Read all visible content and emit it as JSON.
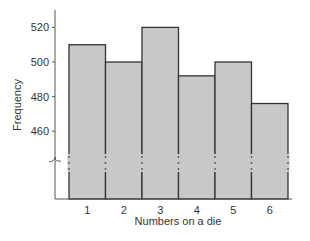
{
  "chart_data": {
    "type": "bar",
    "title": "",
    "xlabel": "Numbers on a die",
    "ylabel": "Frequency",
    "categories": [
      "1",
      "2",
      "3",
      "4",
      "5",
      "6"
    ],
    "values": [
      510,
      500,
      520,
      492,
      500,
      476
    ],
    "yticks": [
      460,
      480,
      500,
      520
    ],
    "ylim": [
      440,
      530
    ],
    "axis_break": true,
    "grid": false,
    "legend": null,
    "bar_color": "#c8c8c8",
    "edge_color": "#333333"
  }
}
